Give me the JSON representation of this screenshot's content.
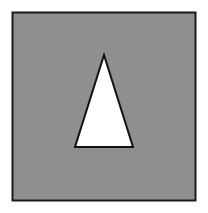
{
  "figure": {
    "background": "#ffffff",
    "square": {
      "x": 12.5,
      "y": 12.5,
      "width": 183,
      "height": 188,
      "fill": "#8f8f8f",
      "stroke": "#1a1a1a"
    },
    "triangle": {
      "points": "104,55 75,147 133,147",
      "fill": "#ffffff",
      "stroke": "#111111"
    }
  }
}
